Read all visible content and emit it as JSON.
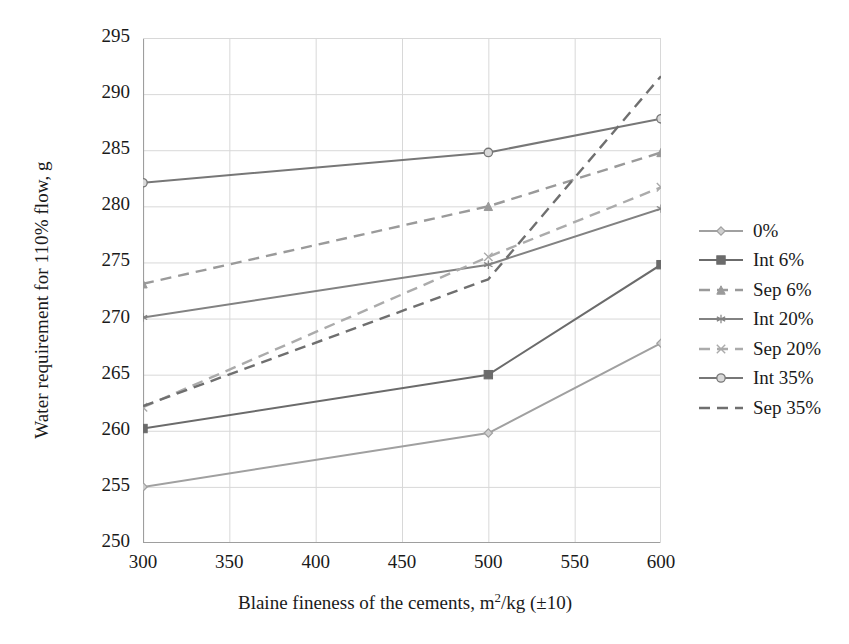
{
  "chart_data": {
    "type": "line",
    "title": "",
    "xlabel": "Blaine fineness of the cements, m2/kg (±10)",
    "xlabel_parts": {
      "pre": "Blaine fineness of the cements, m",
      "sup": "2",
      "post": "/kg (±10)"
    },
    "ylabel": "Water requirement for 110% flow, g",
    "x": [
      300,
      500,
      600
    ],
    "xlim": [
      300,
      600
    ],
    "ylim": [
      250,
      295
    ],
    "xticks": [
      300,
      350,
      400,
      450,
      500,
      550,
      600
    ],
    "yticks": [
      250,
      255,
      260,
      265,
      270,
      275,
      280,
      285,
      290,
      295
    ],
    "grid": true,
    "legend_position": "right",
    "series": [
      {
        "name": "0%",
        "values": [
          255.0,
          259.8,
          267.8
        ],
        "color": "#a0a0a0",
        "linestyle": "solid",
        "marker": "diamond"
      },
      {
        "name": "Int 6%",
        "values": [
          260.2,
          265.0,
          274.8
        ],
        "color": "#6b6b6b",
        "linestyle": "solid",
        "marker": "square"
      },
      {
        "name": "Sep 6%",
        "values": [
          273.1,
          280.0,
          284.8
        ],
        "color": "#9a9a9a",
        "linestyle": "dashed",
        "marker": "triangle"
      },
      {
        "name": "Int 20%",
        "values": [
          270.1,
          274.8,
          279.8
        ],
        "color": "#828282",
        "linestyle": "solid",
        "marker": "star"
      },
      {
        "name": "Sep 20%",
        "values": [
          262.1,
          275.5,
          281.7
        ],
        "color": "#ababab",
        "linestyle": "dashed",
        "marker": "cross"
      },
      {
        "name": "Int 35%",
        "values": [
          282.1,
          284.8,
          287.8
        ],
        "color": "#777777",
        "linestyle": "solid",
        "marker": "circle"
      },
      {
        "name": "Sep 35%",
        "values": [
          262.2,
          273.5,
          291.6
        ],
        "color": "#6f6f6f",
        "linestyle": "dashed",
        "marker": "none"
      }
    ]
  },
  "axis": {
    "ytick_labels": [
      "295",
      "290",
      "285",
      "280",
      "275",
      "270",
      "265",
      "260",
      "255",
      "250"
    ],
    "xtick_labels": [
      "300",
      "350",
      "400",
      "450",
      "500",
      "550",
      "600"
    ]
  },
  "legend": {
    "items": [
      "0%",
      "Int 6%",
      "Sep 6%",
      "Int 20%",
      "Sep 20%",
      "Int 35%",
      "Sep 35%"
    ]
  },
  "colors": {
    "grid": "#d8d8d8",
    "axis": "#9e9e9e",
    "text": "#1a1a1a",
    "background": "#ffffff"
  }
}
